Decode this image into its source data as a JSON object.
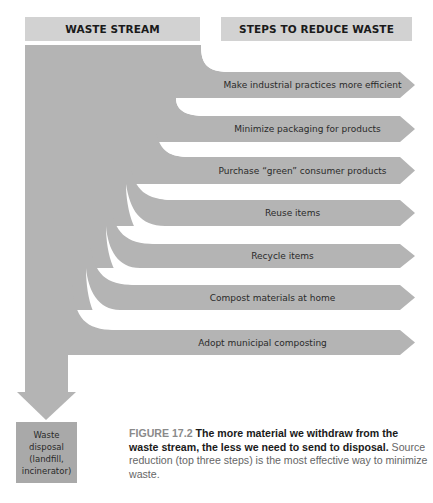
{
  "headers": {
    "waste_stream": "WASTE STREAM",
    "steps": "STEPS TO REDUCE WASTE"
  },
  "steps": [
    {
      "label": "Make industrial practices more efficient",
      "category": "source reduction"
    },
    {
      "label": "Minimize packaging for products",
      "category": "source reduction"
    },
    {
      "label": "Purchase “green” consumer products",
      "category": "source reduction"
    },
    {
      "label": "Reuse items"
    },
    {
      "label": "Recycle items"
    },
    {
      "label": "Compost materials at home"
    },
    {
      "label": "Adopt municipal composting"
    }
  ],
  "disposal": {
    "lines": [
      "Waste",
      "disposal",
      "(landfill,",
      "incinerator)"
    ]
  },
  "caption": {
    "figure_number": "FIGURE 17.2",
    "bold_text": "The more material we withdraw from the waste stream, the less we need to send to disposal.",
    "body_text": "Source reduction (top three steps) is the most effective way to minimize waste."
  },
  "colors": {
    "stream": "#b4b4b4",
    "header_bg": "#d2d2d2",
    "disposal_bg": "#a9a9a9",
    "text_dark": "#1a1a1a"
  }
}
